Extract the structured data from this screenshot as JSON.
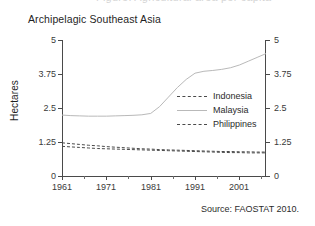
{
  "figure": {
    "title": "Archipelagic Southeast Asia",
    "partial_title_above": "Figure. Agricultural area per capita",
    "source_note": "Source: FAOSTAT 2010."
  },
  "legend": {
    "position": "inside-top-center",
    "entries": [
      {
        "label": "Indonesia",
        "style": "dashed",
        "color": "#4a4a4a"
      },
      {
        "label": "Malaysia",
        "style": "solid",
        "color": "#b9b9b9"
      },
      {
        "label": "Philippines",
        "style": "dashed",
        "color": "#4a4a4a"
      }
    ]
  },
  "axes": {
    "y_title": "Hectares",
    "y_ticks": [
      "0",
      "1.25",
      "2.5",
      "3.75",
      "5"
    ],
    "y_ticks_right": [
      "0",
      "1.25",
      "2.5",
      "3.75",
      "5"
    ],
    "x_ticks": [
      "1961",
      "1971",
      "1981",
      "1991",
      "2001"
    ]
  },
  "chart_data": {
    "type": "line",
    "title": "Archipelagic Southeast Asia",
    "xlabel": "",
    "ylabel": "Hectares",
    "xlim": [
      1961,
      2007
    ],
    "ylim": [
      0,
      5
    ],
    "ytick_values": [
      0,
      1.25,
      2.5,
      3.75,
      5
    ],
    "xtick_values": [
      1961,
      1971,
      1981,
      1991,
      2001
    ],
    "xtick_minor_step": 5,
    "grid": false,
    "legend_position": "upper center (inside axes)",
    "dual_y_axis_mirrored": true,
    "x": [
      1961,
      1963,
      1965,
      1967,
      1969,
      1971,
      1973,
      1975,
      1977,
      1979,
      1981,
      1983,
      1985,
      1987,
      1989,
      1991,
      1993,
      1995,
      1997,
      1999,
      2001,
      2003,
      2005,
      2007
    ],
    "series": [
      {
        "name": "Indonesia",
        "style": "dashed",
        "color": "#4a4a4a",
        "values": [
          1.22,
          1.19,
          1.16,
          1.13,
          1.11,
          1.08,
          1.06,
          1.04,
          1.02,
          1.0,
          0.99,
          0.97,
          0.96,
          0.95,
          0.94,
          0.93,
          0.92,
          0.91,
          0.9,
          0.9,
          0.89,
          0.89,
          0.88,
          0.88
        ]
      },
      {
        "name": "Malaysia",
        "style": "solid",
        "color": "#b9b9b9",
        "values": [
          2.24,
          2.22,
          2.21,
          2.2,
          2.2,
          2.2,
          2.21,
          2.22,
          2.23,
          2.25,
          2.3,
          2.55,
          2.9,
          3.25,
          3.55,
          3.78,
          3.85,
          3.88,
          3.92,
          3.98,
          4.08,
          4.22,
          4.36,
          4.5
        ]
      },
      {
        "name": "Philippines",
        "style": "dashed",
        "color": "#4a4a4a",
        "values": [
          1.09,
          1.07,
          1.05,
          1.03,
          1.01,
          1.0,
          0.99,
          0.98,
          0.97,
          0.96,
          0.95,
          0.94,
          0.93,
          0.92,
          0.91,
          0.9,
          0.89,
          0.88,
          0.87,
          0.86,
          0.86,
          0.85,
          0.85,
          0.85
        ]
      }
    ]
  }
}
